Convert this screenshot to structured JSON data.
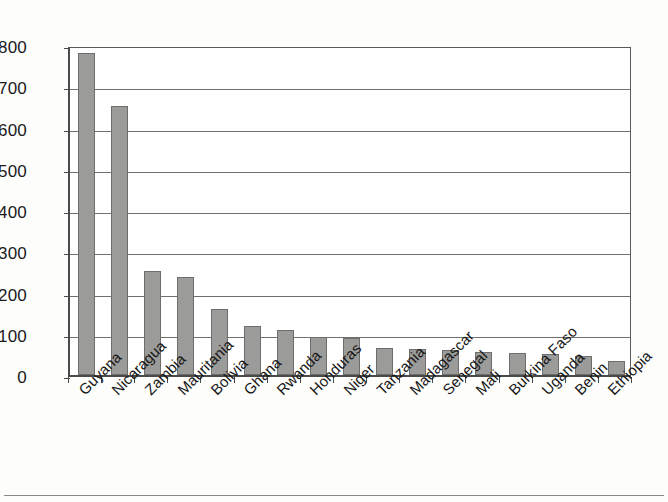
{
  "chart_data": {
    "type": "bar",
    "title": "",
    "subtitle": "",
    "xlabel": "",
    "ylabel": "",
    "ylim": [
      0,
      800
    ],
    "ytick_step": 100,
    "yticks": [
      "800",
      "700",
      "600",
      "500",
      "400",
      "300",
      "200",
      "100",
      "0"
    ],
    "grid": true,
    "legend": false,
    "legend_position": "none",
    "bar_color": "#9b9b99",
    "bar_border_color": "#6d6d6b",
    "axis_color": "#4a4a4a",
    "gridline_color": "#70706e",
    "label_rotation": -45,
    "categories": [
      "Guyana",
      "Nicaragua",
      "Zambia",
      "Mauritania",
      "Bolivia",
      "Ghana",
      "Rwanda",
      "Honduras",
      "Niger",
      "Tanzania",
      "Madagascar",
      "Senegal",
      "Mali",
      "Burkina Faso",
      "Uganda",
      "Benin",
      "Ethiopia"
    ],
    "values": [
      780,
      653,
      253,
      238,
      160,
      118,
      110,
      93,
      90,
      65,
      63,
      60,
      56,
      54,
      50,
      47,
      33
    ]
  }
}
